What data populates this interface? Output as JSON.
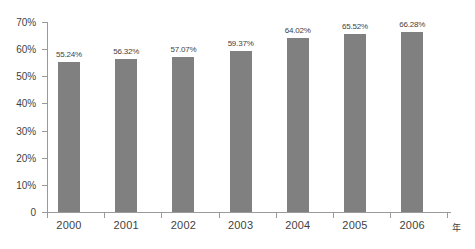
{
  "chart_data": {
    "type": "bar",
    "title": "",
    "subtitle": "",
    "xlabel": "年",
    "ylabel": "",
    "categories": [
      "2000",
      "2001",
      "2002",
      "2003",
      "2004",
      "2005",
      "2006"
    ],
    "values": [
      55.24,
      56.32,
      57.07,
      59.37,
      64.02,
      65.52,
      66.28
    ],
    "data_labels": [
      "55.24%",
      "56.32%",
      "57.07%",
      "59.37%",
      "64.02%",
      "65.52%",
      "66.28%"
    ],
    "ylim": [
      0,
      70
    ],
    "y_tick_values": [
      0,
      10,
      20,
      30,
      40,
      50,
      60,
      70
    ],
    "y_tick_labels": [
      "0",
      "10%",
      "20%",
      "30%",
      "40%",
      "50%",
      "60%",
      "70%"
    ],
    "grid": false,
    "legend": null,
    "legend_position": "none",
    "series": [
      {
        "name": "",
        "values": [
          55.24,
          56.32,
          57.07,
          59.37,
          64.02,
          65.52,
          66.28
        ],
        "color": "#808080"
      }
    ],
    "colors": {
      "bar": "#808080",
      "axis": "#9a9a9a",
      "text": "#3f3f3f",
      "background": "#ffffff"
    }
  }
}
